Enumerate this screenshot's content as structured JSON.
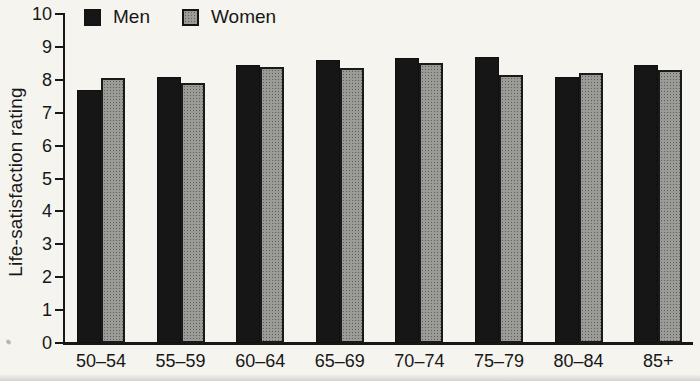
{
  "chart_data": {
    "type": "bar",
    "title": "",
    "xlabel": "",
    "ylabel": "Life-satisfaction rating",
    "ylim": [
      0,
      10
    ],
    "yticks": [
      0,
      1,
      2,
      3,
      4,
      5,
      6,
      7,
      8,
      9,
      10
    ],
    "categories": [
      "50–54",
      "55–59",
      "60–64",
      "65–69",
      "70–74",
      "75–79",
      "80–84",
      "85+"
    ],
    "series": [
      {
        "name": "Men",
        "color": "#161616",
        "pattern": "solid",
        "values": [
          7.7,
          8.1,
          8.45,
          8.6,
          8.65,
          8.7,
          8.1,
          8.45
        ]
      },
      {
        "name": "Women",
        "color": "#9b9b98",
        "pattern": "halftone",
        "values": [
          8.05,
          7.9,
          8.4,
          8.35,
          8.5,
          8.15,
          8.2,
          8.3
        ]
      }
    ],
    "legend_position": "top-left-inside",
    "grid": false
  },
  "colors": {
    "background": "#f5f4ef",
    "axis": "#171717",
    "text": "#171717",
    "men_bar": "#161616",
    "women_bar": "#9b9b98",
    "bar_border": "#171717"
  }
}
